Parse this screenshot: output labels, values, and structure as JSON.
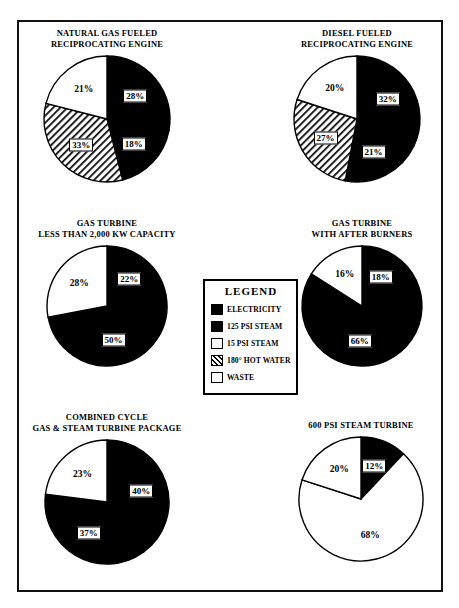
{
  "figure": {
    "border_color": "#111111",
    "background": "#ffffff"
  },
  "legend": {
    "title": "LEGEND",
    "items": [
      {
        "label": "ELECTRICITY",
        "fill": "black"
      },
      {
        "label": "125 PSI STEAM",
        "fill": "black"
      },
      {
        "label": "15 PSI STEAM",
        "fill": "white"
      },
      {
        "label": "180° HOT WATER",
        "fill": "hatch"
      },
      {
        "label": "WASTE",
        "fill": "white"
      }
    ]
  },
  "chart_data": [
    {
      "type": "pie",
      "title": "NATURAL GAS FUELED\nRECIPROCATING ENGINE",
      "title_lines": [
        "NATURAL GAS FUELED",
        "RECIPROCATING ENGINE"
      ],
      "categories": [
        "ELECTRICITY",
        "125 PSI STEAM",
        "180° HOT WATER",
        "WASTE"
      ],
      "values": [
        28,
        18,
        33,
        21
      ],
      "labels": [
        "28%",
        "18%",
        "33%",
        "21%"
      ],
      "fills": [
        "black",
        "black",
        "hatch",
        "white"
      ],
      "boxed_labels": [
        true,
        true,
        true,
        false
      ]
    },
    {
      "type": "pie",
      "title": "DIESEL FUELED\nRECIPROCATING ENGINE",
      "title_lines": [
        "DIESEL FUELED",
        "RECIPROCATING ENGINE"
      ],
      "categories": [
        "ELECTRICITY",
        "125 PSI STEAM",
        "180° HOT WATER",
        "WASTE"
      ],
      "values": [
        32,
        21,
        27,
        20
      ],
      "labels": [
        "32%",
        "21%",
        "27%",
        "20%"
      ],
      "fills": [
        "black",
        "black",
        "hatch",
        "white"
      ],
      "boxed_labels": [
        true,
        true,
        true,
        false
      ]
    },
    {
      "type": "pie",
      "title": "GAS TURBINE\nLESS THAN 2,000 KW CAPACITY",
      "title_lines": [
        "GAS TURBINE",
        "LESS THAN 2,000 KW CAPACITY"
      ],
      "categories": [
        "ELECTRICITY",
        "125 PSI STEAM",
        "WASTE"
      ],
      "values": [
        22,
        50,
        28
      ],
      "labels": [
        "22%",
        "50%",
        "28%"
      ],
      "fills": [
        "black",
        "black",
        "white"
      ],
      "boxed_labels": [
        true,
        true,
        false
      ]
    },
    {
      "type": "pie",
      "title": "GAS TURBINE\nWITH AFTER BURNERS",
      "title_lines": [
        "GAS TURBINE",
        "WITH AFTER BURNERS"
      ],
      "categories": [
        "ELECTRICITY",
        "125 PSI STEAM",
        "WASTE"
      ],
      "values": [
        18,
        66,
        16
      ],
      "labels": [
        "18%",
        "66%",
        "16%"
      ],
      "fills": [
        "black",
        "black",
        "white"
      ],
      "boxed_labels": [
        true,
        true,
        false
      ]
    },
    {
      "type": "pie",
      "title": "COMBINED CYCLE\nGAS & STEAM TURBINE PACKAGE",
      "title_lines": [
        "COMBINED CYCLE",
        "GAS & STEAM TURBINE PACKAGE"
      ],
      "categories": [
        "ELECTRICITY",
        "125 PSI STEAM",
        "WASTE"
      ],
      "values": [
        40,
        37,
        23
      ],
      "labels": [
        "40%",
        "37%",
        "23%"
      ],
      "fills": [
        "black",
        "black",
        "white"
      ],
      "boxed_labels": [
        true,
        true,
        false
      ]
    },
    {
      "type": "pie",
      "title": "600 PSI STEAM TURBINE",
      "title_lines": [
        "600 PSI STEAM TURBINE"
      ],
      "categories": [
        "ELECTRICITY",
        "15 PSI STEAM",
        "WASTE"
      ],
      "values": [
        12,
        68,
        20
      ],
      "labels": [
        "12%",
        "68%",
        "20%"
      ],
      "fills": [
        "black",
        "white",
        "white"
      ],
      "boxed_labels": [
        true,
        false,
        false
      ]
    }
  ],
  "layout": {
    "cells": [
      {
        "left": 22,
        "top": 28,
        "width": 170,
        "radius": 63,
        "title_top": 0
      },
      {
        "left": 272,
        "top": 28,
        "width": 170,
        "radius": 63,
        "title_top": 0
      },
      {
        "left": 22,
        "top": 218,
        "width": 170,
        "radius": 60,
        "title_top": 0
      },
      {
        "left": 282,
        "top": 218,
        "width": 160,
        "radius": 60,
        "title_top": 0
      },
      {
        "left": 16,
        "top": 412,
        "width": 182,
        "radius": 62,
        "title_top": 0
      },
      {
        "left": 278,
        "top": 420,
        "width": 166,
        "radius": 62,
        "title_top": 0
      }
    ]
  }
}
